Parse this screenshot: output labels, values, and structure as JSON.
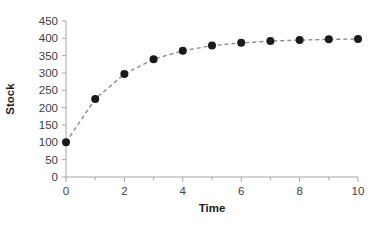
{
  "chart_data": {
    "type": "line",
    "title": "",
    "subtitle": "",
    "xlabel": "Time",
    "ylabel": "Stock",
    "x": [
      0,
      1,
      2,
      3,
      4,
      5,
      6,
      7,
      8,
      9,
      10
    ],
    "values": [
      100,
      225,
      297,
      340,
      364,
      379,
      387,
      392,
      395,
      397,
      398
    ],
    "series": [
      {
        "name": "Stock",
        "x": [
          0,
          1,
          2,
          3,
          4,
          5,
          6,
          7,
          8,
          9,
          10
        ],
        "values": [
          100,
          225,
          297,
          340,
          364,
          379,
          387,
          392,
          395,
          397,
          398
        ]
      }
    ],
    "xlim": [
      0,
      10
    ],
    "ylim": [
      0,
      450
    ],
    "xticks": [
      0,
      2,
      4,
      6,
      8,
      10
    ],
    "xtick_labels": [
      "0",
      "2",
      "4",
      "6",
      "8",
      "10"
    ],
    "xminor_ticks": [
      1,
      3,
      5,
      7,
      9
    ],
    "yticks": [
      0,
      50,
      100,
      150,
      200,
      250,
      300,
      350,
      400,
      450
    ],
    "ytick_labels": [
      "0",
      "50",
      "100",
      "150",
      "200",
      "250",
      "300",
      "350",
      "400",
      "450"
    ],
    "grid": false,
    "legend": false,
    "legend_position": "none",
    "marker": "circle",
    "marker_color": "#1a1a1a",
    "marker_size": 7,
    "line_style": "dashed",
    "line_color": "#8c8c8c",
    "axis_color": "#a6a6a6",
    "background_color": "#ffffff",
    "annotations": []
  },
  "axis_titles": {
    "x": "Time",
    "y": "Stock"
  }
}
